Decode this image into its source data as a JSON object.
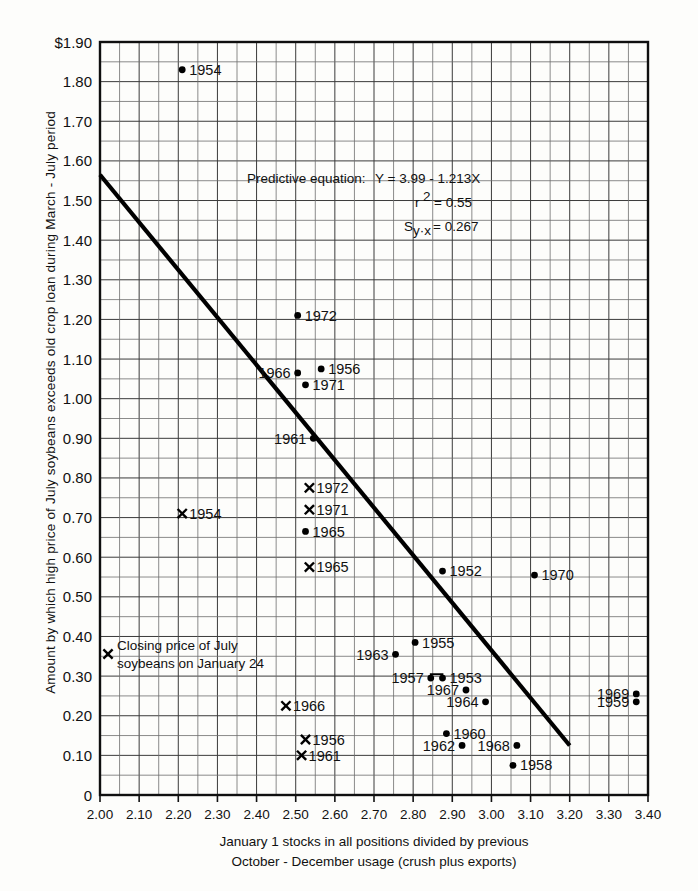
{
  "chart_data": {
    "type": "scatter",
    "title": "",
    "xlabel": "January 1 stocks in all positions divided by previous October - December usage (crush plus exports)",
    "ylabel": "Amount by which high price of July soybeans exceeds old crop loan during March - July period",
    "xlim": [
      2.0,
      3.4
    ],
    "ylim": [
      0,
      1.9
    ],
    "xticks": [
      "2.00",
      "2.10",
      "2.20",
      "2.30",
      "2.40",
      "2.50",
      "2.60",
      "2.70",
      "2.80",
      "2.90",
      "3.00",
      "3.10",
      "3.20",
      "3.30",
      "3.40"
    ],
    "yticks": [
      "$1.90",
      "1.80",
      "1.70",
      "1.60",
      "1.50",
      "1.40",
      "1.30",
      "1.20",
      "1.10",
      "1.00",
      "0.90",
      "0.80",
      "0.70",
      "0.60",
      "0.50",
      "0.40",
      "0.30",
      "0.20",
      "0.10",
      "0"
    ],
    "grid": true,
    "legend_position": "inside-lower-left",
    "annotations": {
      "equation_intro": "Predictive equation:",
      "equation": "Y = 3.99 - 1.213X",
      "r_squared_label": "r",
      "r_squared_sup": "2",
      "r_squared_value": "= 0.55",
      "syx_label": "S",
      "syx_sub": "y·x",
      "syx_value": "= 0.267",
      "legend_line1": "Closing price of July",
      "legend_line2": "soybeans on January 24"
    },
    "caption_line1": "January 1 stocks in all positions divided by previous",
    "caption_line2": "October - December usage (crush plus exports)",
    "trend_line": {
      "x1": 2.0,
      "y1": 1.565,
      "x2": 3.2,
      "y2": 0.125
    },
    "series": [
      {
        "name": "High price of July soybeans over old crop loan",
        "marker": "dot",
        "points": [
          {
            "label": "1954",
            "x": 2.21,
            "y": 1.83,
            "label_pos": "right"
          },
          {
            "label": "1972",
            "x": 2.505,
            "y": 1.21,
            "label_pos": "right"
          },
          {
            "label": "1966",
            "x": 2.505,
            "y": 1.065,
            "label_pos": "left"
          },
          {
            "label": "1956",
            "x": 2.565,
            "y": 1.075,
            "label_pos": "right"
          },
          {
            "label": "1971",
            "x": 2.525,
            "y": 1.035,
            "label_pos": "right"
          },
          {
            "label": "1961",
            "x": 2.545,
            "y": 0.9,
            "label_pos": "left"
          },
          {
            "label": "1965",
            "x": 2.525,
            "y": 0.665,
            "label_pos": "right"
          },
          {
            "label": "1952",
            "x": 2.875,
            "y": 0.565,
            "label_pos": "right"
          },
          {
            "label": "1970",
            "x": 3.11,
            "y": 0.555,
            "label_pos": "right"
          },
          {
            "label": "1955",
            "x": 2.805,
            "y": 0.385,
            "label_pos": "right"
          },
          {
            "label": "1963",
            "x": 2.755,
            "y": 0.355,
            "label_pos": "left"
          },
          {
            "label": "1957",
            "x": 2.845,
            "y": 0.295,
            "label_pos": "left"
          },
          {
            "label": "1953",
            "x": 2.875,
            "y": 0.295,
            "label_pos": "right"
          },
          {
            "label": "1967",
            "x": 2.935,
            "y": 0.265,
            "label_pos": "left"
          },
          {
            "label": "1964",
            "x": 2.985,
            "y": 0.235,
            "label_pos": "left"
          },
          {
            "label": "1969",
            "x": 3.37,
            "y": 0.255,
            "label_pos": "left"
          },
          {
            "label": "1959",
            "x": 3.37,
            "y": 0.235,
            "label_pos": "left"
          },
          {
            "label": "1960",
            "x": 2.885,
            "y": 0.155,
            "label_pos": "right"
          },
          {
            "label": "1962",
            "x": 2.925,
            "y": 0.125,
            "label_pos": "left"
          },
          {
            "label": "1968",
            "x": 3.065,
            "y": 0.125,
            "label_pos": "left"
          },
          {
            "label": "1958",
            "x": 3.055,
            "y": 0.075,
            "label_pos": "right"
          }
        ]
      },
      {
        "name": "Closing price of July soybeans on January 24",
        "marker": "cross",
        "points": [
          {
            "label": "1954",
            "x": 2.21,
            "y": 0.71,
            "label_pos": "right"
          },
          {
            "label": "1972",
            "x": 2.535,
            "y": 0.775,
            "label_pos": "right"
          },
          {
            "label": "1971",
            "x": 2.535,
            "y": 0.72,
            "label_pos": "right"
          },
          {
            "label": "1965",
            "x": 2.535,
            "y": 0.575,
            "label_pos": "right"
          },
          {
            "label": "1966",
            "x": 2.475,
            "y": 0.225,
            "label_pos": "right"
          },
          {
            "label": "1956",
            "x": 2.525,
            "y": 0.14,
            "label_pos": "right"
          },
          {
            "label": "1961",
            "x": 2.515,
            "y": 0.1,
            "label_pos": "right"
          }
        ]
      }
    ]
  }
}
